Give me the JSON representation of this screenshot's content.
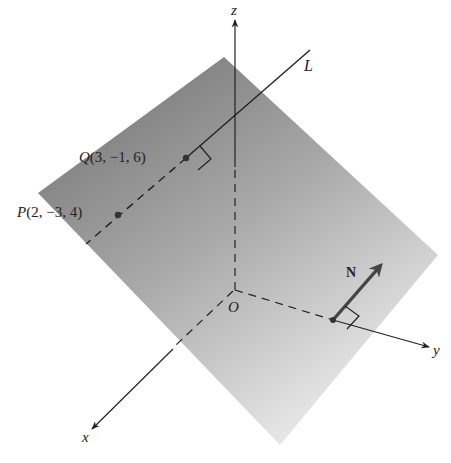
{
  "figure": {
    "colors": {
      "background": "#ffffff",
      "plane_dark": "#858585",
      "plane_light": "#e6e6e6",
      "ink": "#222222"
    },
    "axes": {
      "x_label": "x",
      "y_label": "y",
      "z_label": "z",
      "origin_label": "O"
    },
    "points": {
      "P": {
        "label": "P(2, −3, 4)",
        "name": "P",
        "coords": [
          2,
          -3,
          4
        ]
      },
      "Q": {
        "label": "Q(3, −1, 6)",
        "name": "Q",
        "coords": [
          3,
          -1,
          6
        ]
      }
    },
    "line": {
      "label": "L"
    },
    "normal": {
      "label": "N"
    }
  }
}
